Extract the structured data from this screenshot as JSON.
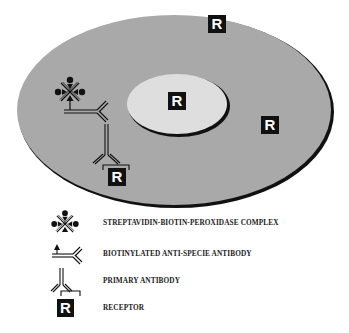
{
  "diagram": {
    "colors": {
      "cell": "#a9a9a9",
      "nucleus": "#dedede",
      "outline": "#111111",
      "receptor_bg": "#111111",
      "receptor_fg": "#ffffff"
    },
    "receptors": [
      {
        "label": "R",
        "location": "cell-surface-top"
      },
      {
        "label": "R",
        "location": "nucleus"
      },
      {
        "label": "R",
        "location": "cytoplasm-right"
      },
      {
        "label": "R",
        "location": "bound-to-primary-antibody"
      }
    ],
    "legend": [
      {
        "icon": "streptavidin-biotin-peroxidase-complex-icon",
        "label": "STREPTAVIDIN-BIOTIN-PEROXIDASE COMPLEX"
      },
      {
        "icon": "biotinylated-antibody-icon",
        "label": "BIOTINYLATED ANTI-SPECIE ANTIBODY"
      },
      {
        "icon": "primary-antibody-icon",
        "label": "PRIMARY ANTIBODY"
      },
      {
        "icon": "receptor-icon",
        "label": "RECEPTOR",
        "symbol": "R"
      }
    ]
  }
}
